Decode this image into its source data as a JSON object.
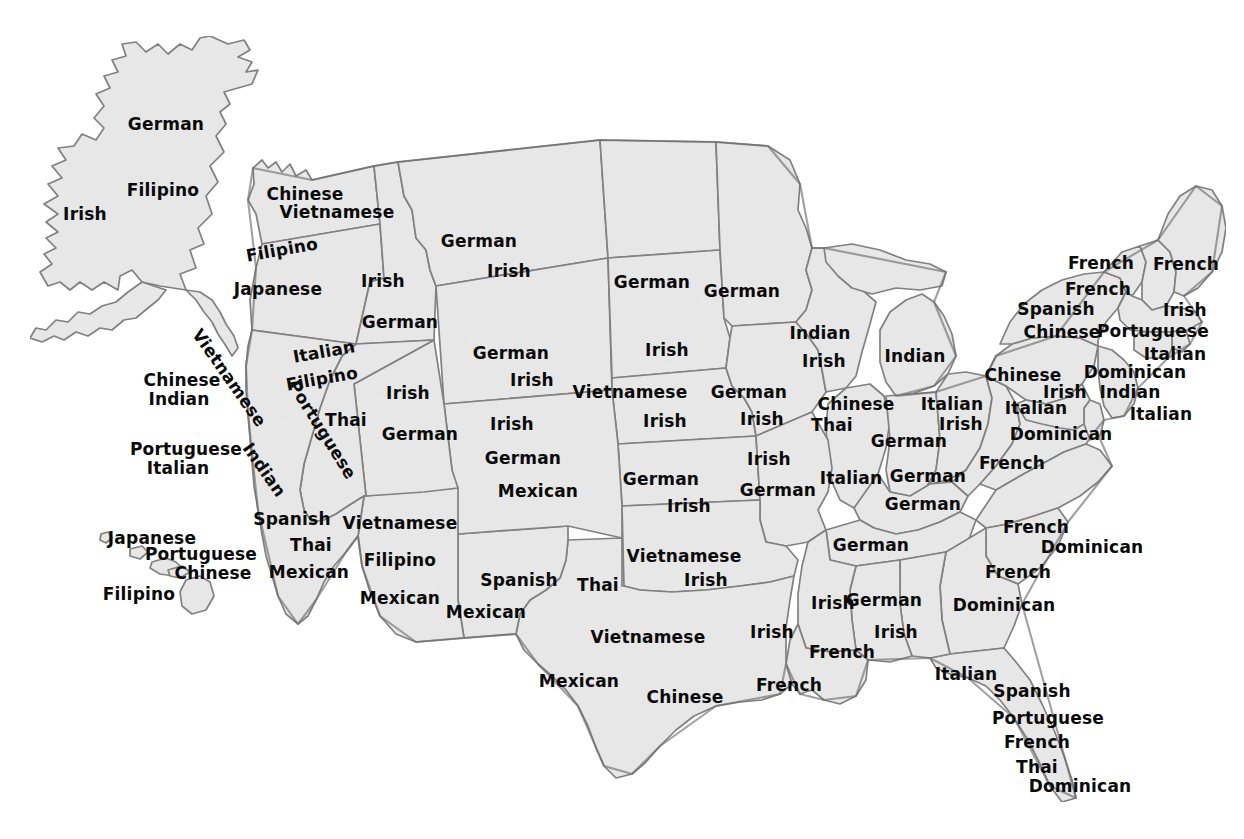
{
  "map": {
    "title": "Most common ancestry / ethnic origin by U.S. state",
    "style": {
      "land_fill": "#e9e9e9",
      "border_color": "#7d7d7d",
      "outline_color": "#6e6e6e",
      "label_color": "#0a0a0a",
      "background": "#ffffff"
    },
    "labels": [
      {
        "id": "ak-1",
        "text": "German",
        "state": "Alaska",
        "x": 166,
        "y": 124,
        "rot": ""
      },
      {
        "id": "ak-2",
        "text": "Filipino",
        "state": "Alaska",
        "x": 163,
        "y": 190,
        "rot": ""
      },
      {
        "id": "ak-3",
        "text": "Irish",
        "state": "Alaska",
        "x": 85,
        "y": 214,
        "rot": ""
      },
      {
        "id": "hi-1",
        "text": "Japanese",
        "state": "Hawaii",
        "x": 152,
        "y": 538,
        "rot": ""
      },
      {
        "id": "hi-2",
        "text": "Portuguese",
        "state": "Hawaii",
        "x": 201,
        "y": 554,
        "rot": ""
      },
      {
        "id": "hi-3",
        "text": "Chinese",
        "state": "Hawaii",
        "x": 213,
        "y": 573,
        "rot": ""
      },
      {
        "id": "hi-4",
        "text": "Filipino",
        "state": "Hawaii",
        "x": 139,
        "y": 594,
        "rot": ""
      },
      {
        "id": "wa-1",
        "text": "Chinese",
        "state": "Washington",
        "x": 305,
        "y": 194,
        "rot": ""
      },
      {
        "id": "wa-2",
        "text": "Vietnamese",
        "state": "Washington",
        "x": 337,
        "y": 212,
        "rot": ""
      },
      {
        "id": "or-1",
        "text": "Filipino",
        "state": "Oregon",
        "x": 282,
        "y": 250,
        "rot": "rot-m10"
      },
      {
        "id": "or-2",
        "text": "Japanese",
        "state": "Oregon",
        "x": 278,
        "y": 289,
        "rot": ""
      },
      {
        "id": "id-1",
        "text": "Irish",
        "state": "Idaho",
        "x": 383,
        "y": 281,
        "rot": ""
      },
      {
        "id": "id-2",
        "text": "German",
        "state": "Idaho",
        "x": 400,
        "y": 322,
        "rot": ""
      },
      {
        "id": "mt-1",
        "text": "German",
        "state": "Montana",
        "x": 479,
        "y": 241,
        "rot": ""
      },
      {
        "id": "mt-2",
        "text": "Irish",
        "state": "Montana",
        "x": 509,
        "y": 271,
        "rot": ""
      },
      {
        "id": "nd-1",
        "text": "German",
        "state": "North Dakota",
        "x": 652,
        "y": 282,
        "rot": ""
      },
      {
        "id": "sd-1",
        "text": "Irish",
        "state": "South Dakota",
        "x": 667,
        "y": 350,
        "rot": ""
      },
      {
        "id": "mn-1",
        "text": "German",
        "state": "Minnesota",
        "x": 742,
        "y": 291,
        "rot": ""
      },
      {
        "id": "wy-1",
        "text": "German",
        "state": "Wyoming",
        "x": 511,
        "y": 353,
        "rot": ""
      },
      {
        "id": "wy-2",
        "text": "Irish",
        "state": "Wyoming",
        "x": 532,
        "y": 380,
        "rot": ""
      },
      {
        "id": "nv-1",
        "text": "Italian",
        "state": "Nevada",
        "x": 324,
        "y": 352,
        "rot": "rot-m10"
      },
      {
        "id": "nv-2",
        "text": "Filipino",
        "state": "Nevada",
        "x": 322,
        "y": 379,
        "rot": "rot-m10"
      },
      {
        "id": "nv-3",
        "text": "Portuguese",
        "state": "Nevada",
        "x": 322,
        "y": 430,
        "rot": "rot-58"
      },
      {
        "id": "nv-4",
        "text": "Thai",
        "state": "Nevada",
        "x": 346,
        "y": 420,
        "rot": ""
      },
      {
        "id": "ut-1",
        "text": "Irish",
        "state": "Utah",
        "x": 408,
        "y": 393,
        "rot": ""
      },
      {
        "id": "ut-2",
        "text": "German",
        "state": "Utah",
        "x": 420,
        "y": 434,
        "rot": ""
      },
      {
        "id": "ca-ext1",
        "text": "Chinese",
        "state": "California",
        "x": 182,
        "y": 380,
        "rot": ""
      },
      {
        "id": "ca-ext2",
        "text": "Indian",
        "state": "California",
        "x": 179,
        "y": 399,
        "rot": ""
      },
      {
        "id": "ca-ext3",
        "text": "Portuguese",
        "state": "California",
        "x": 186,
        "y": 449,
        "rot": ""
      },
      {
        "id": "ca-ext4",
        "text": "Italian",
        "state": "California",
        "x": 178,
        "y": 468,
        "rot": ""
      },
      {
        "id": "ca-1",
        "text": "Vietnamese",
        "state": "California",
        "x": 229,
        "y": 378,
        "rot": "rot-55"
      },
      {
        "id": "ca-2",
        "text": "Indian",
        "state": "California",
        "x": 264,
        "y": 470,
        "rot": "rot-55"
      },
      {
        "id": "ca-3",
        "text": "Spanish",
        "state": "California",
        "x": 292,
        "y": 519,
        "rot": ""
      },
      {
        "id": "ca-4",
        "text": "Thai",
        "state": "California",
        "x": 311,
        "y": 545,
        "rot": ""
      },
      {
        "id": "ca-5",
        "text": "Mexican",
        "state": "California",
        "x": 309,
        "y": 572,
        "rot": ""
      },
      {
        "id": "az-1",
        "text": "Vietnamese",
        "state": "Arizona",
        "x": 400,
        "y": 523,
        "rot": ""
      },
      {
        "id": "az-2",
        "text": "Filipino",
        "state": "Arizona",
        "x": 400,
        "y": 560,
        "rot": ""
      },
      {
        "id": "az-3",
        "text": "Mexican",
        "state": "Arizona",
        "x": 400,
        "y": 598,
        "rot": ""
      },
      {
        "id": "co-1",
        "text": "Irish",
        "state": "Colorado",
        "x": 512,
        "y": 424,
        "rot": ""
      },
      {
        "id": "co-2",
        "text": "German",
        "state": "Colorado",
        "x": 523,
        "y": 458,
        "rot": ""
      },
      {
        "id": "co-3",
        "text": "Mexican",
        "state": "Colorado",
        "x": 538,
        "y": 491,
        "rot": ""
      },
      {
        "id": "nm-1",
        "text": "Spanish",
        "state": "New Mexico",
        "x": 519,
        "y": 580,
        "rot": ""
      },
      {
        "id": "nm-2",
        "text": "Mexican",
        "state": "New Mexico",
        "x": 486,
        "y": 612,
        "rot": ""
      },
      {
        "id": "ne-1",
        "text": "Vietnamese",
        "state": "Nebraska",
        "x": 630,
        "y": 392,
        "rot": ""
      },
      {
        "id": "ne-2",
        "text": "Irish",
        "state": "Nebraska",
        "x": 665,
        "y": 421,
        "rot": ""
      },
      {
        "id": "ia-1",
        "text": "German",
        "state": "Iowa",
        "x": 749,
        "y": 392,
        "rot": ""
      },
      {
        "id": "ia-2",
        "text": "Irish",
        "state": "Iowa",
        "x": 762,
        "y": 419,
        "rot": ""
      },
      {
        "id": "ks-1",
        "text": "German",
        "state": "Kansas",
        "x": 661,
        "y": 479,
        "rot": ""
      },
      {
        "id": "ks-2",
        "text": "Irish",
        "state": "Kansas",
        "x": 689,
        "y": 506,
        "rot": ""
      },
      {
        "id": "mo-1",
        "text": "Irish",
        "state": "Missouri",
        "x": 769,
        "y": 459,
        "rot": ""
      },
      {
        "id": "mo-2",
        "text": "German",
        "state": "Missouri",
        "x": 778,
        "y": 490,
        "rot": ""
      },
      {
        "id": "ok-1",
        "text": "Vietnamese",
        "state": "Oklahoma",
        "x": 684,
        "y": 556,
        "rot": ""
      },
      {
        "id": "ok-2",
        "text": "Irish",
        "state": "Oklahoma",
        "x": 706,
        "y": 580,
        "rot": ""
      },
      {
        "id": "tx-1",
        "text": "Thai",
        "state": "Texas",
        "x": 598,
        "y": 585,
        "rot": ""
      },
      {
        "id": "tx-2",
        "text": "Vietnamese",
        "state": "Texas",
        "x": 648,
        "y": 637,
        "rot": ""
      },
      {
        "id": "tx-3",
        "text": "Mexican",
        "state": "Texas",
        "x": 579,
        "y": 681,
        "rot": ""
      },
      {
        "id": "tx-4",
        "text": "Chinese",
        "state": "Texas",
        "x": 685,
        "y": 697,
        "rot": ""
      },
      {
        "id": "wi-1",
        "text": "Indian",
        "state": "Wisconsin",
        "x": 820,
        "y": 333,
        "rot": ""
      },
      {
        "id": "wi-2",
        "text": "Irish",
        "state": "Wisconsin",
        "x": 824,
        "y": 361,
        "rot": ""
      },
      {
        "id": "mi-1",
        "text": "Indian",
        "state": "Michigan",
        "x": 915,
        "y": 356,
        "rot": ""
      },
      {
        "id": "il-1",
        "text": "Chinese",
        "state": "Illinois",
        "x": 856,
        "y": 404,
        "rot": ""
      },
      {
        "id": "il-2",
        "text": "Thai",
        "state": "Illinois",
        "x": 832,
        "y": 425,
        "rot": ""
      },
      {
        "id": "il-3",
        "text": "Italian",
        "state": "Illinois",
        "x": 851,
        "y": 478,
        "rot": ""
      },
      {
        "id": "in-1",
        "text": "German",
        "state": "Indiana",
        "x": 909,
        "y": 441,
        "rot": ""
      },
      {
        "id": "oh-1",
        "text": "Italian",
        "state": "Ohio",
        "x": 952,
        "y": 404,
        "rot": ""
      },
      {
        "id": "oh-2",
        "text": "Irish",
        "state": "Ohio",
        "x": 961,
        "y": 424,
        "rot": ""
      },
      {
        "id": "ky-1",
        "text": "German",
        "state": "Kentucky",
        "x": 923,
        "y": 504,
        "rot": ""
      },
      {
        "id": "tn-1",
        "text": "German",
        "state": "Tennessee",
        "x": 871,
        "y": 545,
        "rot": ""
      },
      {
        "id": "ar-1",
        "text": "Irish",
        "state": "Arkansas",
        "x": 772,
        "y": 632,
        "rot": ""
      },
      {
        "id": "la-1",
        "text": "French",
        "state": "Louisiana",
        "x": 789,
        "y": 685,
        "rot": ""
      },
      {
        "id": "ms-1",
        "text": "Irish",
        "state": "Mississippi",
        "x": 833,
        "y": 603,
        "rot": ""
      },
      {
        "id": "ms-2",
        "text": "French",
        "state": "Mississippi",
        "x": 842,
        "y": 652,
        "rot": ""
      },
      {
        "id": "al-1",
        "text": "German",
        "state": "Alabama",
        "x": 884,
        "y": 600,
        "rot": ""
      },
      {
        "id": "al-2",
        "text": "Irish",
        "state": "Alabama",
        "x": 896,
        "y": 632,
        "rot": ""
      },
      {
        "id": "ga-1",
        "text": "Dominican",
        "state": "Georgia",
        "x": 1004,
        "y": 605,
        "rot": ""
      },
      {
        "id": "fl-1",
        "text": "Italian",
        "state": "Florida",
        "x": 966,
        "y": 674,
        "rot": ""
      },
      {
        "id": "fl-2",
        "text": "Spanish",
        "state": "Florida",
        "x": 1032,
        "y": 691,
        "rot": ""
      },
      {
        "id": "fl-3",
        "text": "Portuguese",
        "state": "Florida",
        "x": 1048,
        "y": 718,
        "rot": ""
      },
      {
        "id": "fl-4",
        "text": "French",
        "state": "Florida",
        "x": 1037,
        "y": 742,
        "rot": ""
      },
      {
        "id": "fl-5",
        "text": "Thai",
        "state": "Florida",
        "x": 1037,
        "y": 767,
        "rot": ""
      },
      {
        "id": "fl-6",
        "text": "Dominican",
        "state": "Florida",
        "x": 1080,
        "y": 786,
        "rot": ""
      },
      {
        "id": "sc-1",
        "text": "French",
        "state": "South Carolina",
        "x": 1018,
        "y": 572,
        "rot": ""
      },
      {
        "id": "nc-1",
        "text": "French",
        "state": "North Carolina",
        "x": 1036,
        "y": 527,
        "rot": ""
      },
      {
        "id": "nc-2",
        "text": "Dominican",
        "state": "North Carolina",
        "x": 1092,
        "y": 547,
        "rot": ""
      },
      {
        "id": "va-1",
        "text": "French",
        "state": "Virginia",
        "x": 1012,
        "y": 463,
        "rot": ""
      },
      {
        "id": "wv-1",
        "text": "German",
        "state": "West Virginia",
        "x": 928,
        "y": 476,
        "rot": ""
      },
      {
        "id": "md-1",
        "text": "Dominican",
        "state": "Maryland",
        "x": 1061,
        "y": 434,
        "rot": ""
      },
      {
        "id": "pa-1",
        "text": "Chinese",
        "state": "Pennsylvania",
        "x": 1023,
        "y": 375,
        "rot": ""
      },
      {
        "id": "pa-2",
        "text": "Irish",
        "state": "Pennsylvania",
        "x": 1065,
        "y": 392,
        "rot": ""
      },
      {
        "id": "pa-3",
        "text": "Italian",
        "state": "Pennsylvania",
        "x": 1036,
        "y": 408,
        "rot": ""
      },
      {
        "id": "ny-1",
        "text": "French",
        "state": "New York",
        "x": 1098,
        "y": 289,
        "rot": ""
      },
      {
        "id": "ny-2",
        "text": "Spanish",
        "state": "New York",
        "x": 1056,
        "y": 309,
        "rot": ""
      },
      {
        "id": "ny-3",
        "text": "Chinese",
        "state": "New York",
        "x": 1062,
        "y": 332,
        "rot": ""
      },
      {
        "id": "vt-1",
        "text": "French",
        "state": "Vermont",
        "x": 1101,
        "y": 263,
        "rot": ""
      },
      {
        "id": "me-1",
        "text": "French",
        "state": "Maine",
        "x": 1186,
        "y": 264,
        "rot": ""
      },
      {
        "id": "nh-1",
        "text": "Irish",
        "state": "New Hampshire",
        "x": 1185,
        "y": 310,
        "rot": ""
      },
      {
        "id": "ma-1",
        "text": "Portuguese",
        "state": "Massachusetts",
        "x": 1153,
        "y": 331,
        "rot": ""
      },
      {
        "id": "ri-1",
        "text": "Italian",
        "state": "Rhode Island",
        "x": 1175,
        "y": 354,
        "rot": ""
      },
      {
        "id": "ct-1",
        "text": "Dominican",
        "state": "Connecticut",
        "x": 1135,
        "y": 372,
        "rot": ""
      },
      {
        "id": "ct-2",
        "text": "Indian",
        "state": "Connecticut",
        "x": 1130,
        "y": 392,
        "rot": ""
      },
      {
        "id": "nj-1",
        "text": "Italian",
        "state": "New Jersey",
        "x": 1161,
        "y": 414,
        "rot": ""
      }
    ]
  }
}
